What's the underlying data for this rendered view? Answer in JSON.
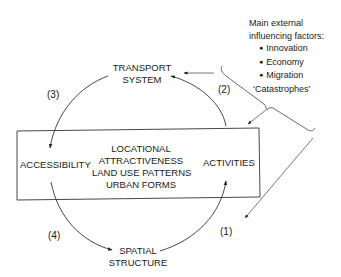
{
  "diagram": {
    "nodes": {
      "transport": [
        "TRANSPORT",
        "SYSTEM"
      ],
      "accessibility": "ACCESSIBILITY",
      "activities": "ACTIVITIES",
      "spatial": [
        "SPATIAL",
        "STRUCTURE"
      ],
      "center": [
        "LOCATIONAL",
        "ATTRACTIVENESS",
        "LAND USE PATTERNS",
        "URBAN FORMS"
      ]
    },
    "cycle_labels": {
      "one": "(1)",
      "two": "(2)",
      "three": "(3)",
      "four": "(4)"
    },
    "external_factors": {
      "heading_line1": "Main external",
      "heading_line2": "influencing factors:",
      "items": [
        "Innovation",
        "Economy",
        "Migration"
      ],
      "extra": "‘Catastrophes’"
    },
    "colors": {
      "line": "#333333",
      "text": "#1a1a1a",
      "background": "#ffffff"
    }
  }
}
